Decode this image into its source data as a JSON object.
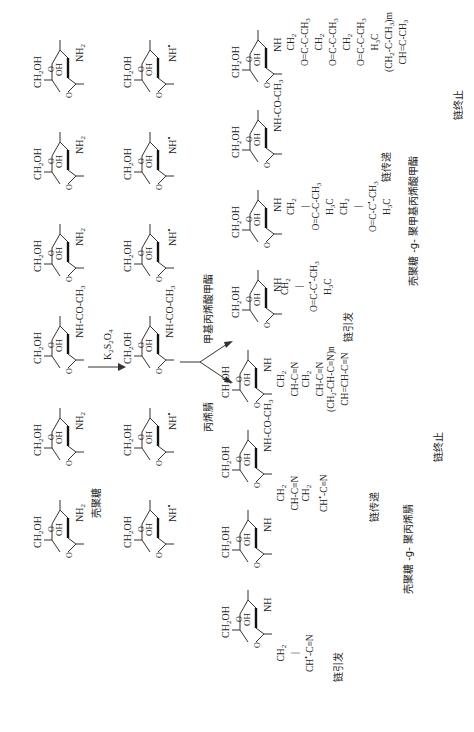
{
  "reaction": {
    "reagent": "K2S2O4",
    "branch_up": "甲基丙烯酸甲酯",
    "branch_down": "丙烯腈"
  },
  "labels": {
    "chitosan": "壳聚糖",
    "chitosan_g_pmma": "壳聚糖 -g- 聚甲基丙烯酸甲酯",
    "chitosan_g_pan": "壳聚糖 -g- 聚丙烯腈",
    "initiation": "链引发",
    "propagation": "链传递",
    "termination": "链终止"
  },
  "chitosan_chain": {
    "ring_top": "CH2OH",
    "ring_oh": "OH",
    "ring_o": "O",
    "substituents": [
      "NH2",
      "NH2",
      "NH2",
      "NH-CO-CH3",
      "NH2",
      "NH2"
    ]
  },
  "radical_chain": {
    "substituents": [
      "NH•",
      "NH•",
      "NH•",
      "NH-CO-CH3",
      "NH•",
      "NH•"
    ]
  },
  "pmma_chain": {
    "substituents": [
      "NH",
      "NH-CO-CH3",
      "NH",
      "NH"
    ],
    "initiation_graft": [
      "NH",
      "CH2",
      "C•(CH3)",
      "O=C-O-CH3"
    ],
    "repeat_index": "m"
  },
  "pan_chain": {
    "substituents": [
      "NH",
      "NH-CO-CH3",
      "NH",
      "NH"
    ],
    "initiation_graft": [
      "NH",
      "CH2",
      "CH•-C≡N"
    ],
    "repeat_index": "n"
  }
}
